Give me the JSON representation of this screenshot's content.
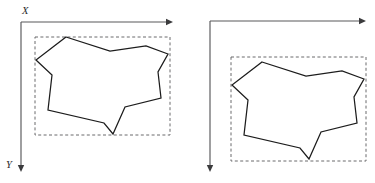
{
  "figure": {
    "title": "",
    "caption": "",
    "panels": [
      {
        "id": "panel-left",
        "name": "left-panel",
        "axis_labels": {
          "x": "X",
          "y": "Y"
        },
        "x_axis": {
          "from": [
            21,
            22
          ],
          "to": [
            173,
            22
          ],
          "arrow": "right"
        },
        "y_axis": {
          "from": [
            21,
            22
          ],
          "to": [
            21,
            172
          ],
          "arrow": "down"
        },
        "x_label_pos": [
          22,
          14
        ],
        "y_label_pos": [
          6,
          168
        ],
        "bounding_box": {
          "x": 35,
          "y": 37,
          "width": 135,
          "height": 98
        },
        "polygon": [
          [
            66,
            37
          ],
          [
            110,
            51
          ],
          [
            146,
            46
          ],
          [
            168,
            54
          ],
          [
            158,
            72
          ],
          [
            161,
            98
          ],
          [
            125,
            107
          ],
          [
            113,
            134
          ],
          [
            104,
            123
          ],
          [
            48,
            110
          ],
          [
            52,
            75
          ],
          [
            36,
            60
          ]
        ]
      },
      {
        "id": "panel-right",
        "name": "right-panel",
        "axis_labels": {
          "x": "",
          "y": ""
        },
        "x_axis": {
          "from": [
            210,
            21
          ],
          "to": [
            366,
            21
          ],
          "arrow": "right"
        },
        "y_axis": {
          "from": [
            210,
            21
          ],
          "to": [
            210,
            172
          ],
          "arrow": "down"
        },
        "x_label_pos": [
          211,
          13
        ],
        "y_label_pos": [
          195,
          167
        ],
        "bounding_box": {
          "x": 231,
          "y": 57,
          "width": 135,
          "height": 104
        },
        "polygon": [
          [
            262,
            62
          ],
          [
            306,
            76
          ],
          [
            342,
            71
          ],
          [
            364,
            79
          ],
          [
            354,
            97
          ],
          [
            357,
            123
          ],
          [
            321,
            132
          ],
          [
            309,
            159
          ],
          [
            300,
            148
          ],
          [
            244,
            135
          ],
          [
            248,
            100
          ],
          [
            232,
            85
          ]
        ]
      }
    ],
    "colors": {
      "polygon_stroke": "#1c1c1c",
      "polygon_fill": "#ffffff",
      "bbox_stroke": "#6b6b6d",
      "axis_stroke": "#58585a",
      "label_color": "#2a2a2c",
      "background": "#ffffff"
    }
  }
}
